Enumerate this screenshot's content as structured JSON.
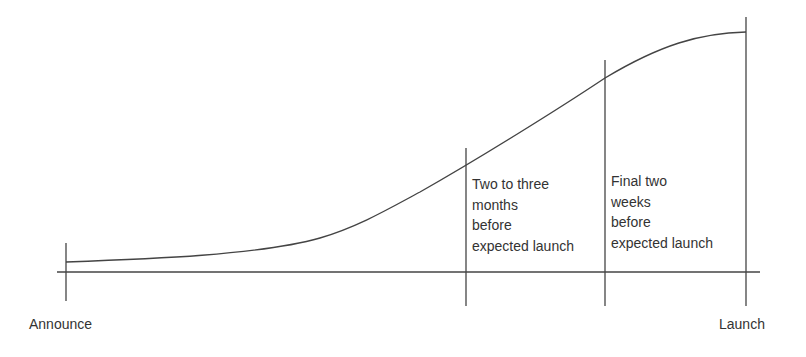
{
  "diagram": {
    "type": "adoption-curve-timeline",
    "axis": {
      "start_label": "Announce",
      "end_label": "Launch"
    },
    "phases": [
      {
        "label": "Two to three\nmonths\nbefore\nexpected launch"
      },
      {
        "label": "Final two\nweeks\nbefore\nexpected launch"
      }
    ],
    "colors": {
      "line": "#444444",
      "text": "#333333",
      "background": "#ffffff"
    }
  }
}
